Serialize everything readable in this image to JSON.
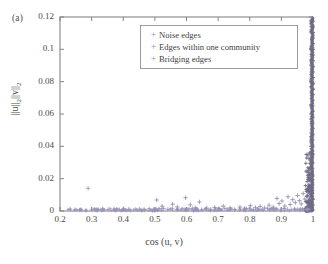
{
  "figure": {
    "panel_label": "(a)",
    "background": "#ffffff",
    "frame_color": "#7a7a7a",
    "marker_color": "#8f88ab",
    "dense_color": "#6f6a85"
  },
  "legend": {
    "position": "upper-right",
    "entries": [
      {
        "marker": "+",
        "label": "Noise edges"
      },
      {
        "marker": "+",
        "label": "Edges within one community"
      },
      {
        "marker": "+",
        "label": "Bridging edges"
      }
    ]
  },
  "chart_data": {
    "type": "scatter",
    "title": "",
    "xlabel": "cos (u, v)",
    "ylabel": "||u||₂||v||₂",
    "xlim": [
      0.2,
      1.0
    ],
    "ylim": [
      0,
      0.12
    ],
    "xticks": [
      0.2,
      0.3,
      0.4,
      0.5,
      0.6,
      0.7,
      0.8,
      0.9,
      1
    ],
    "xticklabels": [
      "0.2",
      "0.3",
      "0.4",
      "0.5",
      "0.6",
      "0.7",
      "0.8",
      "0.9",
      "1"
    ],
    "yticks": [
      0,
      0.02,
      0.04,
      0.06,
      0.08,
      0.1,
      0.12
    ],
    "yticklabels": [
      "0",
      "0.02",
      "0.04",
      "0.06",
      "0.08",
      "0.1",
      "0.12"
    ],
    "grid": false,
    "legend_position": "upper right",
    "series": [
      {
        "name": "Noise edges",
        "marker": "+",
        "color": "#9a93b8",
        "points": [
          [
            0.232,
            0.0012
          ],
          [
            0.248,
            0.0008
          ],
          [
            0.262,
            0.0006
          ],
          [
            0.289,
            0.014
          ],
          [
            0.301,
            0.001
          ],
          [
            0.318,
            0.0007
          ],
          [
            0.336,
            0.0011
          ],
          [
            0.352,
            0.0009
          ],
          [
            0.371,
            0.0013
          ],
          [
            0.388,
            0.0008
          ],
          [
            0.402,
            0.0015
          ],
          [
            0.417,
            0.001
          ],
          [
            0.433,
            0.0007
          ],
          [
            0.451,
            0.0012
          ],
          [
            0.468,
            0.0009
          ],
          [
            0.482,
            0.0014
          ],
          [
            0.497,
            0.0011
          ],
          [
            0.512,
            0.0008
          ],
          [
            0.528,
            0.0016
          ],
          [
            0.541,
            0.001
          ],
          [
            0.556,
            0.0013
          ],
          [
            0.572,
            0.0009
          ],
          [
            0.588,
            0.0012
          ],
          [
            0.604,
            0.0008
          ],
          [
            0.619,
            0.0015
          ],
          [
            0.633,
            0.0011
          ],
          [
            0.648,
            0.0009
          ],
          [
            0.662,
            0.0013
          ],
          [
            0.677,
            0.001
          ],
          [
            0.692,
            0.0012
          ],
          [
            0.706,
            0.0008
          ],
          [
            0.721,
            0.0014
          ],
          [
            0.737,
            0.0011
          ],
          [
            0.752,
            0.0009
          ],
          [
            0.768,
            0.0012
          ],
          [
            0.783,
            0.001
          ],
          [
            0.798,
            0.0013
          ],
          [
            0.812,
            0.0008
          ],
          [
            0.826,
            0.0011
          ],
          [
            0.841,
            0.0009
          ],
          [
            0.856,
            0.0014
          ],
          [
            0.871,
            0.001
          ],
          [
            0.884,
            0.0012
          ],
          [
            0.897,
            0.0008
          ],
          [
            0.908,
            0.0015
          ],
          [
            0.919,
            0.0011
          ],
          [
            0.931,
            0.0009
          ],
          [
            0.942,
            0.0013
          ],
          [
            0.951,
            0.001
          ],
          [
            0.96,
            0.0012
          ],
          [
            0.968,
            0.0008
          ],
          [
            0.975,
            0.0014
          ]
        ]
      },
      {
        "name": "Edges within one community",
        "marker": "+",
        "color": "#8f88ab",
        "points": [
          [
            0.506,
            0.0068
          ],
          [
            0.523,
            0.003
          ],
          [
            0.556,
            0.0042
          ],
          [
            0.571,
            0.0025
          ],
          [
            0.597,
            0.0082
          ],
          [
            0.612,
            0.0038
          ],
          [
            0.628,
            0.002
          ],
          [
            0.641,
            0.0056
          ],
          [
            0.664,
            0.0018
          ],
          [
            0.689,
            0.0022
          ],
          [
            0.703,
            0.0016
          ],
          [
            0.716,
            0.003
          ],
          [
            0.738,
            0.0019
          ],
          [
            0.769,
            0.0024
          ],
          [
            0.784,
            0.0017
          ],
          [
            0.802,
            0.0033
          ],
          [
            0.818,
            0.0021
          ],
          [
            0.833,
            0.0028
          ],
          [
            0.847,
            0.0019
          ],
          [
            0.861,
            0.0036
          ],
          [
            0.874,
            0.0024
          ],
          [
            0.886,
            0.0078
          ],
          [
            0.893,
            0.0046
          ],
          [
            0.902,
            0.0062
          ],
          [
            0.911,
            0.0031
          ],
          [
            0.921,
            0.0088
          ],
          [
            0.928,
            0.004
          ],
          [
            0.936,
            0.007
          ],
          [
            0.944,
            0.0052
          ],
          [
            0.951,
            0.0096
          ],
          [
            0.957,
            0.0064
          ],
          [
            0.963,
            0.0044
          ],
          [
            0.969,
            0.0108
          ],
          [
            0.974,
            0.0074
          ],
          [
            0.979,
            0.0058
          ],
          [
            0.983,
            0.0092
          ],
          [
            0.986,
            0.012
          ],
          [
            0.989,
            0.008
          ],
          [
            0.991,
            0.014
          ],
          [
            0.993,
            0.0102
          ]
        ]
      },
      {
        "name": "Bridging edges",
        "marker": "+",
        "color": "#6f6a85",
        "points": [
          [
            0.995,
            0.002
          ],
          [
            0.995,
            0.0055
          ],
          [
            0.996,
            0.009
          ],
          [
            0.996,
            0.0125
          ],
          [
            0.997,
            0.016
          ],
          [
            0.997,
            0.0195
          ],
          [
            0.997,
            0.023
          ],
          [
            0.998,
            0.0265
          ],
          [
            0.998,
            0.03
          ],
          [
            0.998,
            0.0335
          ],
          [
            0.998,
            0.037
          ],
          [
            0.998,
            0.0405
          ],
          [
            0.999,
            0.044
          ],
          [
            0.999,
            0.0475
          ],
          [
            0.999,
            0.051
          ],
          [
            0.999,
            0.0545
          ],
          [
            0.999,
            0.058
          ],
          [
            0.999,
            0.0615
          ],
          [
            0.999,
            0.065
          ],
          [
            0.999,
            0.0685
          ],
          [
            0.999,
            0.072
          ],
          [
            1.0,
            0.0755
          ],
          [
            1.0,
            0.079
          ],
          [
            1.0,
            0.0825
          ],
          [
            1.0,
            0.086
          ],
          [
            1.0,
            0.0895
          ],
          [
            1.0,
            0.093
          ],
          [
            1.0,
            0.0965
          ],
          [
            1.0,
            0.1
          ],
          [
            1.0,
            0.1035
          ],
          [
            1.0,
            0.107
          ],
          [
            1.0,
            0.1105
          ],
          [
            1.0,
            0.114
          ],
          [
            1.0,
            0.1175
          ],
          [
            0.999,
            0.0038
          ],
          [
            0.999,
            0.0072
          ],
          [
            0.998,
            0.0108
          ],
          [
            0.997,
            0.0145
          ],
          [
            0.996,
            0.018
          ],
          [
            0.998,
            0.0215
          ]
        ]
      }
    ]
  }
}
